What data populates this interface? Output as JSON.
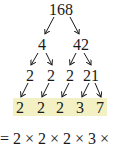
{
  "factor_tree": {
    "root": "168",
    "level1": [
      "4",
      "42"
    ],
    "level2": [
      "2",
      "2",
      "2",
      "21"
    ],
    "prime_factors": [
      "2",
      "2",
      "2",
      "3",
      "7"
    ]
  },
  "equation": "= 2 × 2 × 2 × 3 ×",
  "colors": {
    "highlight": "#f3f0c4",
    "text": "#1a1a1a"
  }
}
